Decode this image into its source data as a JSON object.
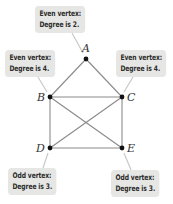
{
  "diagram": {
    "title": "",
    "colors": {
      "edge": "#8a8a8a",
      "vertex": "#111111",
      "callout_bg": "#e6e7e5",
      "callout_text": "#2a2a2a",
      "pointer": "#c8c9c6"
    },
    "vertices": [
      {
        "id": "A",
        "label": "A",
        "x": 86,
        "y": 59,
        "degree": 2,
        "parity": "even"
      },
      {
        "id": "B",
        "label": "B",
        "x": 50,
        "y": 97,
        "degree": 4,
        "parity": "even"
      },
      {
        "id": "C",
        "label": "C",
        "x": 122,
        "y": 97,
        "degree": 4,
        "parity": "even"
      },
      {
        "id": "D",
        "label": "D",
        "x": 50,
        "y": 148,
        "degree": 3,
        "parity": "odd"
      },
      {
        "id": "E",
        "label": "E",
        "x": 122,
        "y": 148,
        "degree": 3,
        "parity": "odd"
      }
    ],
    "edges": [
      [
        "A",
        "B"
      ],
      [
        "A",
        "C"
      ],
      [
        "B",
        "C"
      ],
      [
        "B",
        "D"
      ],
      [
        "C",
        "E"
      ],
      [
        "D",
        "E"
      ],
      [
        "B",
        "E"
      ],
      [
        "C",
        "D"
      ]
    ],
    "callouts": {
      "A": {
        "line1": "Even vertex:",
        "line2": "Degree is 2."
      },
      "B": {
        "line1": "Even vertex:",
        "line2": "Degree is 4."
      },
      "C": {
        "line1": "Even vertex:",
        "line2": "Degree is 4."
      },
      "D": {
        "line1": "Odd vertex:",
        "line2": "Degree is 3."
      },
      "E": {
        "line1": "Odd vertex:",
        "line2": "Degree is 3."
      }
    }
  }
}
